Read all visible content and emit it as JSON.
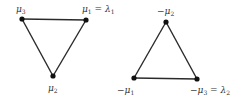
{
  "diagram": {
    "type": "weight-diagram-triangles",
    "left_triangle": {
      "vertices": [
        {
          "id": "mu3",
          "label": "μ",
          "sub": "3",
          "suffix": "",
          "suffix_sub": ""
        },
        {
          "id": "mu1",
          "label": "μ",
          "sub": "1",
          "suffix": " = λ",
          "suffix_sub": "1"
        },
        {
          "id": "mu2",
          "label": "μ",
          "sub": "2",
          "suffix": "",
          "suffix_sub": ""
        }
      ],
      "edges": [
        [
          "mu3",
          "mu1"
        ],
        [
          "mu1",
          "mu2"
        ],
        [
          "mu2",
          "mu3"
        ]
      ]
    },
    "right_triangle": {
      "vertices": [
        {
          "id": "neg_mu2",
          "label": "−μ",
          "sub": "2",
          "suffix": "",
          "suffix_sub": ""
        },
        {
          "id": "neg_mu1",
          "label": "−μ",
          "sub": "1",
          "suffix": "",
          "suffix_sub": ""
        },
        {
          "id": "neg_mu3",
          "label": "−μ",
          "sub": "3",
          "suffix": " = λ",
          "suffix_sub": "2"
        }
      ],
      "edges": [
        [
          "neg_mu2",
          "neg_mu3"
        ],
        [
          "neg_mu3",
          "neg_mu1"
        ],
        [
          "neg_mu1",
          "neg_mu2"
        ]
      ]
    },
    "colors": {
      "line": "#2a2a2a",
      "vertex": "#111111",
      "text": "#333333",
      "background": "#ffffff"
    }
  }
}
